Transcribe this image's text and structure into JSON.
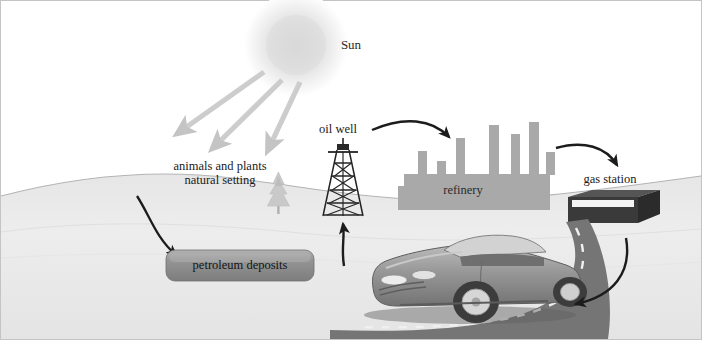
{
  "figure": {
    "labels": {
      "sun": "Sun",
      "nature_line1": "animals and plants",
      "nature_line2": "natural setting",
      "oil_well": "oil well",
      "refinery": "refinery",
      "gas_station": "gas station",
      "petroleum_deposits": "petroleum deposits"
    },
    "icons": {
      "sun": "sun-icon",
      "tree": "conifer-tree-icon",
      "derrick": "oil-derrick-icon",
      "refinery": "refinery-silhouette-icon",
      "gas_station": "gas-station-building-icon",
      "car": "convertible-car-icon",
      "road": "curved-road-icon"
    },
    "arrows": [
      {
        "name": "sunray-left",
        "from": "sun",
        "to": "ground-left",
        "style": "light-gray"
      },
      {
        "name": "sunray-middle",
        "from": "sun",
        "to": "natural-setting",
        "style": "light-gray"
      },
      {
        "name": "sunray-right",
        "from": "sun",
        "to": "natural-setting",
        "style": "light-gray"
      },
      {
        "name": "nature-to-petroleum",
        "from": "animals and plants natural setting",
        "to": "petroleum deposits",
        "style": "dark-curve"
      },
      {
        "name": "petroleum-to-oilwell",
        "from": "petroleum deposits",
        "to": "oil well",
        "style": "dark-straight-up"
      },
      {
        "name": "oilwell-to-refinery",
        "from": "oil well",
        "to": "refinery",
        "style": "dark-curve"
      },
      {
        "name": "refinery-to-gasstation",
        "from": "refinery",
        "to": "gas station",
        "style": "dark-curve"
      },
      {
        "name": "gasstation-to-car",
        "from": "gas station",
        "to": "car on road",
        "style": "dark-curve"
      }
    ],
    "colors": {
      "background": "#ffffff",
      "ground": "#ededed",
      "ground_line": "#b8b8b8",
      "sun_glow": "#e8e8e8",
      "sun_ray": "#c9c9c9",
      "arrow_dark": "#1c1c1c",
      "refinery_fill": "#a8a8a8",
      "deposit_fill": "#8d8d8d",
      "road_fill": "#777777",
      "road_dash": "#f2f2f2",
      "gas_station_fill": "#3b3b3b",
      "car_body": "#8e8e8e",
      "tree_fill": "#c5c5c5",
      "derrick_stroke": "#222222",
      "border": "#bdbdbd",
      "text": "#1a1a1a"
    }
  }
}
